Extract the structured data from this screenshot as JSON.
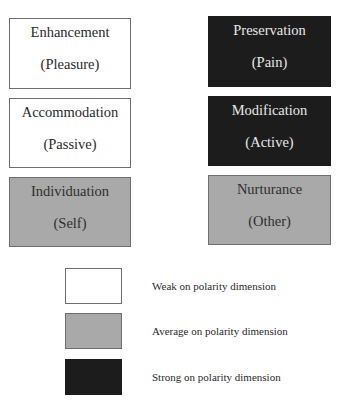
{
  "diagram": {
    "boxes": [
      {
        "title": "Enhancement",
        "subtitle": "(Pleasure)",
        "strength": "weak"
      },
      {
        "title": "Preservation",
        "subtitle": "(Pain)",
        "strength": "strong"
      },
      {
        "title": "Accommodation",
        "subtitle": "(Passive)",
        "strength": "weak"
      },
      {
        "title": "Modification",
        "subtitle": "(Active)",
        "strength": "strong"
      },
      {
        "title": "Individuation",
        "subtitle": "(Self)",
        "strength": "average"
      },
      {
        "title": "Nurturance",
        "subtitle": "(Other)",
        "strength": "average"
      }
    ],
    "legend": [
      {
        "label": "Weak on polarity dimension",
        "color": "#ffffff"
      },
      {
        "label": "Average on polarity dimension",
        "color": "#a9a9a9"
      },
      {
        "label": "Strong on polarity dimension",
        "color": "#1c1c1c"
      }
    ]
  }
}
